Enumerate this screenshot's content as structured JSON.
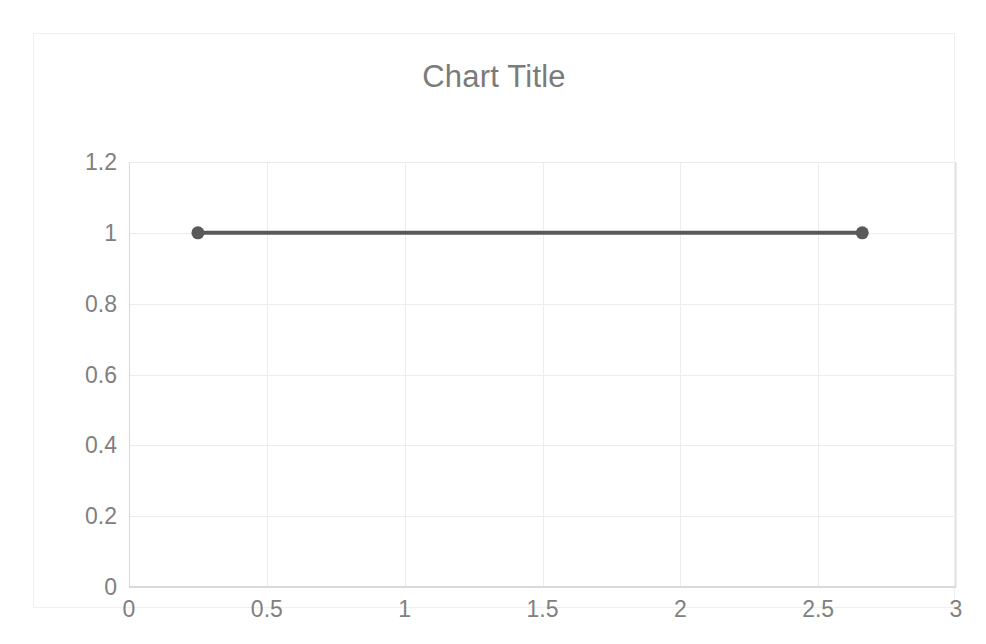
{
  "chart_data": {
    "type": "line",
    "title": "Chart Title",
    "xlabel": "",
    "ylabel": "",
    "xlim": [
      0,
      3
    ],
    "ylim": [
      0,
      1.2
    ],
    "grid": true,
    "legend": false,
    "legend_position": "none",
    "x_ticks": [
      "0",
      "0.5",
      "1",
      "1.5",
      "2",
      "2.5",
      "3"
    ],
    "x_tick_values": [
      0,
      0.5,
      1,
      1.5,
      2,
      2.5,
      3
    ],
    "y_ticks": [
      "1.2",
      "1",
      "0.8",
      "0.6",
      "0.4",
      "0.2",
      "0"
    ],
    "y_tick_values": [
      1.2,
      1,
      0.8,
      0.6,
      0.4,
      0.2,
      0
    ],
    "series": [
      {
        "name": "Series 1",
        "color": "#595959",
        "marker": "circle",
        "marker_size": 13,
        "line_width": 4,
        "x": [
          0.25,
          2.66
        ],
        "y": [
          1,
          1
        ],
        "points": [
          {
            "x": 0.25,
            "y": 1
          },
          {
            "x": 2.66,
            "y": 1
          }
        ]
      }
    ]
  },
  "style": {
    "title_color": "#7b7b7b",
    "tick_label_color": "#808080",
    "gridline_color": "#ececec",
    "axis_color": "#d9d9d9",
    "frame_color": "#f0f0f0",
    "plot_background": "#ffffff",
    "series_color": "#595959"
  }
}
